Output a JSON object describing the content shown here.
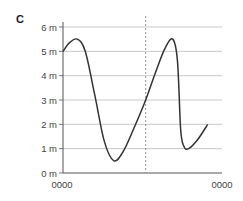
{
  "panel_label": "C",
  "chart_data": {
    "type": "line",
    "title": "",
    "xlabel": "",
    "ylabel": "",
    "y_ticks": [
      "0 m",
      "1 m",
      "2 m",
      "3 m",
      "4 m",
      "5 m",
      "6 m"
    ],
    "y_tick_values": [
      0,
      1,
      2,
      3,
      4,
      5,
      6
    ],
    "x_tick_labels": [
      "0000",
      "0000"
    ],
    "ylim": [
      0,
      6
    ],
    "grid": true,
    "legend": null,
    "annotations": [
      {
        "type": "vertical-dashed-line",
        "x_fraction": 0.52
      }
    ],
    "series": [
      {
        "name": "water level",
        "x": [
          0.0,
          0.04,
          0.09,
          0.14,
          0.2,
          0.26,
          0.32,
          0.38,
          0.45,
          0.52,
          0.58,
          0.64,
          0.69,
          0.72,
          0.74,
          0.76,
          0.79,
          0.85,
          0.91
        ],
        "values": [
          5.0,
          5.35,
          5.5,
          5.0,
          3.2,
          1.3,
          0.5,
          0.9,
          1.9,
          3.0,
          4.1,
          5.1,
          5.5,
          4.6,
          1.8,
          1.1,
          1.0,
          1.4,
          2.0
        ]
      }
    ]
  },
  "colors": {
    "line": "#333333",
    "grid": "#bbbbbb",
    "axis": "#555555",
    "dashed": "#777777"
  }
}
